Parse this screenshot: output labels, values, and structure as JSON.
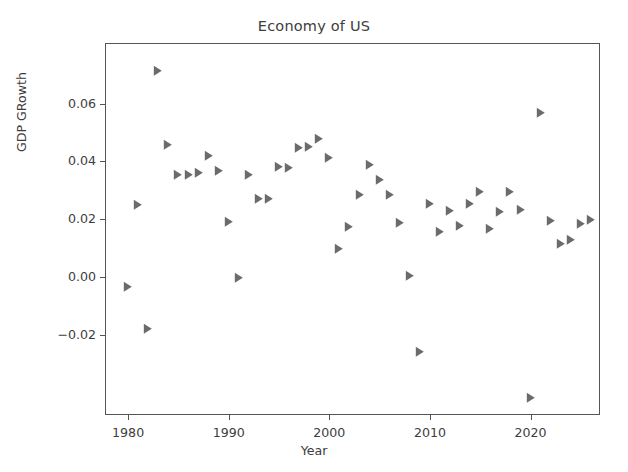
{
  "chart_data": {
    "type": "scatter",
    "title": "Economy of US",
    "xlabel": "Year",
    "ylabel": "GDP GRowth",
    "xlim": [
      1977.8,
      2027.0
    ],
    "ylim": [
      -0.0481,
      0.0806
    ],
    "xticks": [
      1980,
      1990,
      2000,
      2010,
      2020
    ],
    "xtick_labels": [
      "1980",
      "1990",
      "2000",
      "2010",
      "2020"
    ],
    "yticks": [
      -0.02,
      0.0,
      0.02,
      0.04,
      0.06
    ],
    "ytick_labels": [
      "−0.02",
      "0.00",
      "0.02",
      "0.04",
      "0.06"
    ],
    "grid": false,
    "legend": false,
    "marker": "triangle-right",
    "marker_color": "#6b6b6b",
    "series": [
      {
        "name": "GDP Growth",
        "x": [
          1980,
          1981,
          1982,
          1983,
          1984,
          1985,
          1986,
          1987,
          1988,
          1989,
          1990,
          1991,
          1992,
          1993,
          1994,
          1995,
          1996,
          1997,
          1998,
          1999,
          2000,
          2001,
          2002,
          2003,
          2004,
          2005,
          2006,
          2007,
          2008,
          2009,
          2010,
          2011,
          2012,
          2013,
          2014,
          2015,
          2016,
          2017,
          2018,
          2019,
          2020,
          2021,
          2022,
          2023,
          2024,
          2025,
          2026
        ],
        "y": [
          -0.0035,
          0.0249,
          -0.0181,
          0.0713,
          0.0458,
          0.0353,
          0.0352,
          0.036,
          0.0419,
          0.0368,
          0.019,
          -0.0002,
          0.0352,
          0.0269,
          0.0269,
          0.038,
          0.0377,
          0.0447,
          0.0449,
          0.0479,
          0.041,
          0.0096,
          0.0174,
          0.0285,
          0.0387,
          0.0335,
          0.0285,
          0.0188,
          0.0004,
          -0.0261,
          0.0254,
          0.0155,
          0.0228,
          0.0177,
          0.0253,
          0.0295,
          0.0167,
          0.0224,
          0.0295,
          0.023,
          -0.0418,
          0.0567,
          0.0194,
          0.0113,
          0.0128,
          0.0182,
          0.0196
        ]
      }
    ]
  }
}
